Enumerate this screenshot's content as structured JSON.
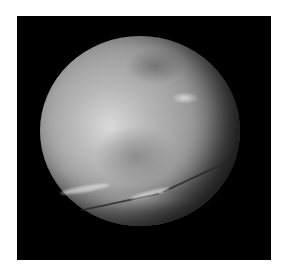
{
  "image": {
    "subject": "moon-charon",
    "description": "Grayscale photograph of a cratered moon with a dark polar region and canyon system on a black background",
    "background_color": "#000000",
    "border_color": "#ffffff"
  }
}
